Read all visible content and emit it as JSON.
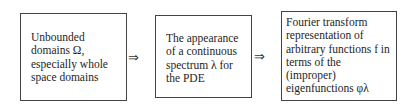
{
  "diagram": {
    "type": "flowchart",
    "direction": "left-to-right",
    "nodes": [
      {
        "id": "n1",
        "text": "Unbounded\ndomains Ω,\nespecially whole\nspace domains"
      },
      {
        "id": "n2",
        "text": "The appearance\nof a continuous\nspectrum λ for\nthe PDE"
      },
      {
        "id": "n3",
        "text": "Fourier transform\nrepresentation of\narbitrary functions f in\nterms of the\n(improper)\neigenfunctions φλ"
      }
    ],
    "edges": [
      {
        "from": "n1",
        "to": "n2",
        "symbol": "⇒"
      },
      {
        "from": "n2",
        "to": "n3",
        "symbol": "⇒"
      }
    ]
  }
}
